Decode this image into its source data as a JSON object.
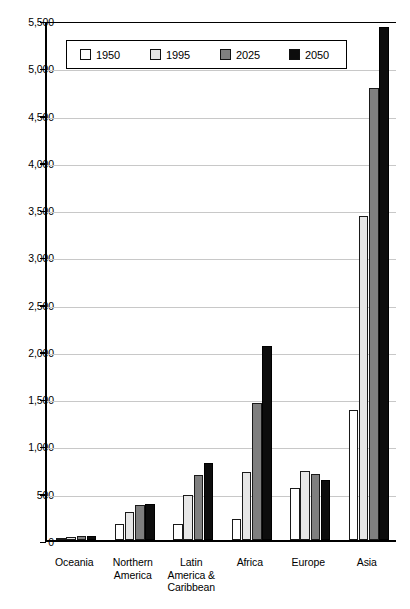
{
  "chart_data": {
    "type": "bar",
    "title": "",
    "xlabel": "",
    "ylabel": "",
    "ylim": [
      0,
      5500
    ],
    "ytick_step": 500,
    "grid": true,
    "legend_position": "top-center",
    "categories": [
      "Oceania",
      "Northern America",
      "Latin America & Caribbean",
      "Africa",
      "Europe",
      "Asia"
    ],
    "category_lines": [
      [
        "Oceania"
      ],
      [
        "Northern",
        "America"
      ],
      [
        "Latin",
        "America &",
        "Caribbean"
      ],
      [
        "Africa"
      ],
      [
        "Europe"
      ],
      [
        "Asia"
      ]
    ],
    "ytick_labels": [
      "0",
      "500",
      "1,000",
      "1,500",
      "2,000",
      "2,500",
      "3,000",
      "3,500",
      "4,000",
      "4,500",
      "5,000",
      "5,500"
    ],
    "ytick_values": [
      0,
      500,
      1000,
      1500,
      2000,
      2500,
      3000,
      3500,
      4000,
      4500,
      5000,
      5500
    ],
    "series": [
      {
        "name": "1950",
        "color": "#ffffff",
        "values": [
          13,
          172,
          167,
          224,
          548,
          1380
        ]
      },
      {
        "name": "1995",
        "color": "#e6e6e6",
        "values": [
          28,
          297,
          480,
          720,
          727,
          3430
        ]
      },
      {
        "name": "2025",
        "color": "#7f7f7f",
        "values": [
          41,
          370,
          690,
          1450,
          701,
          4780
        ]
      },
      {
        "name": "2050",
        "color": "#0d0d0d",
        "values": [
          46,
          384,
          810,
          2050,
          638,
          5430
        ]
      }
    ]
  },
  "legend": {
    "items": [
      {
        "label": "1950"
      },
      {
        "label": "1995"
      },
      {
        "label": "2025"
      },
      {
        "label": "2050"
      }
    ]
  }
}
